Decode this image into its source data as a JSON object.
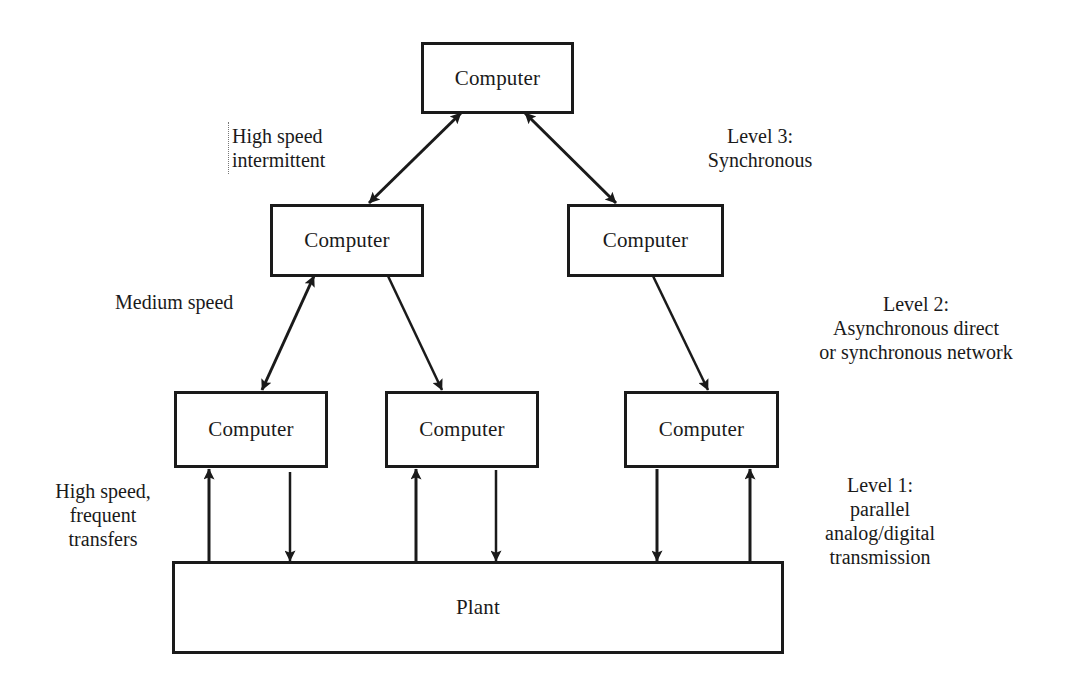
{
  "diagram": {
    "type": "hierarchical computer control architecture",
    "nodes": {
      "top": {
        "label": "Computer",
        "level": 3
      },
      "l2_left": {
        "label": "Computer",
        "level": 2
      },
      "l2_right": {
        "label": "Computer",
        "level": 2
      },
      "l1_left": {
        "label": "Computer",
        "level": 1
      },
      "l1_mid": {
        "label": "Computer",
        "level": 1
      },
      "l1_right": {
        "label": "Computer",
        "level": 1
      },
      "plant": {
        "label": "Plant"
      }
    },
    "annotations": {
      "high_speed_intermittent": {
        "line1": "High speed",
        "line2": "intermittent"
      },
      "level3": {
        "line1": "Level 3:",
        "line2": "Synchronous"
      },
      "medium_speed": {
        "line1": "Medium speed"
      },
      "level2": {
        "line1": "Level 2:",
        "line2": "Asynchronous direct",
        "line3": "or synchronous network"
      },
      "high_speed_frequent": {
        "line1": "High speed,",
        "line2": "frequent",
        "line3": "transfers"
      },
      "level1": {
        "line1": "Level 1:",
        "line2": "parallel",
        "line3": "analog/digital",
        "line4": "transmission"
      }
    },
    "edges": [
      {
        "from": "top",
        "to": "l2_left",
        "direction": "bidirectional"
      },
      {
        "from": "top",
        "to": "l2_right",
        "direction": "bidirectional"
      },
      {
        "from": "l2_left",
        "to": "l1_left",
        "direction": "bidirectional"
      },
      {
        "from": "l2_left",
        "to": "l1_mid",
        "direction": "forward"
      },
      {
        "from": "l2_right",
        "to": "l1_right",
        "direction": "forward"
      },
      {
        "from": "plant",
        "to": "l1_left",
        "direction": "forward"
      },
      {
        "from": "l1_left",
        "to": "plant",
        "direction": "forward"
      },
      {
        "from": "plant",
        "to": "l1_mid",
        "direction": "forward"
      },
      {
        "from": "l1_mid",
        "to": "plant",
        "direction": "forward"
      },
      {
        "from": "l1_right",
        "to": "plant",
        "direction": "forward"
      },
      {
        "from": "plant",
        "to": "l1_right",
        "direction": "forward"
      }
    ],
    "colors": {
      "stroke": "#1a1a1a",
      "background": "#ffffff"
    }
  }
}
